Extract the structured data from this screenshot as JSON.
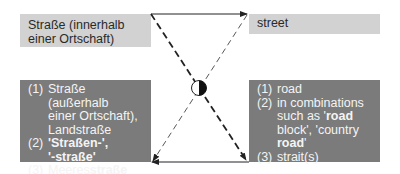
{
  "source": {
    "term": "Straße (innerhalb einer Ortschaft)",
    "term_line1": "Straße (innerhalb",
    "term_line2": "einer Ortschaft)",
    "senses": [
      {
        "num": "(1)",
        "lines": [
          "Straße (außerhalb",
          "einer Ortschaft),",
          "Landstraße"
        ]
      },
      {
        "num": "(2)",
        "lines": [
          "'Straßen-',",
          "'-straße'"
        ],
        "bold": true
      },
      {
        "num": "(3)",
        "prefix": "Meeres",
        "bold_part": "straße"
      }
    ]
  },
  "target": {
    "term": "street",
    "senses": [
      {
        "num": "(1)",
        "lines": [
          "road"
        ]
      },
      {
        "num": "(2)",
        "line1": "in combinations",
        "line2_prefix": "such as '",
        "line2_bold": "road",
        "line3": "block', 'country",
        "line4_bold": "road",
        "line4_suffix": "'"
      },
      {
        "num": "(3)",
        "lines": [
          "strait(s)"
        ]
      }
    ]
  },
  "colors": {
    "light_box": "#d2d2d2",
    "dark_box": "#7b7b7b",
    "line": "#222222"
  },
  "connector": {
    "center_symbol": "half-filled-circle"
  }
}
